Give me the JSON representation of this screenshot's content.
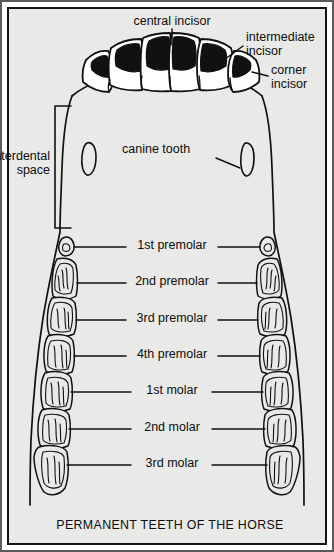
{
  "figure": {
    "caption": "PERMANENT TEETH OF THE HORSE",
    "background_color": "#e9e9e7",
    "line_color": "#111111",
    "enamel_fill_color": "#111111",
    "frame_color": "#5a5a5a"
  },
  "labels": {
    "central_incisor": "central incisor",
    "intermediate_incisor_line1": "intermediate",
    "intermediate_incisor_line2": "incisor",
    "corner_incisor_line1": "corner",
    "corner_incisor_line2": "incisor",
    "interdental_space_line1": "interdental",
    "interdental_space_line2": "space",
    "canine_tooth": "canine tooth"
  },
  "cheek_teeth_rows": [
    {
      "label": "1st premolar",
      "y": 247
    },
    {
      "label": "2nd premolar",
      "y": 283
    },
    {
      "label": "3rd premolar",
      "y": 320
    },
    {
      "label": "4th premolar",
      "y": 356
    },
    {
      "label": "1st molar",
      "y": 392
    },
    {
      "label": "2nd molar",
      "y": 429
    },
    {
      "label": "3rd molar",
      "y": 465
    }
  ],
  "anatomy": {
    "incisor_count": 6,
    "incisor_names": [
      "corner incisor",
      "intermediate incisor",
      "central incisor",
      "central incisor",
      "intermediate incisor",
      "corner incisor"
    ],
    "canine_count": 2,
    "cheek_teeth_per_side": 7
  }
}
